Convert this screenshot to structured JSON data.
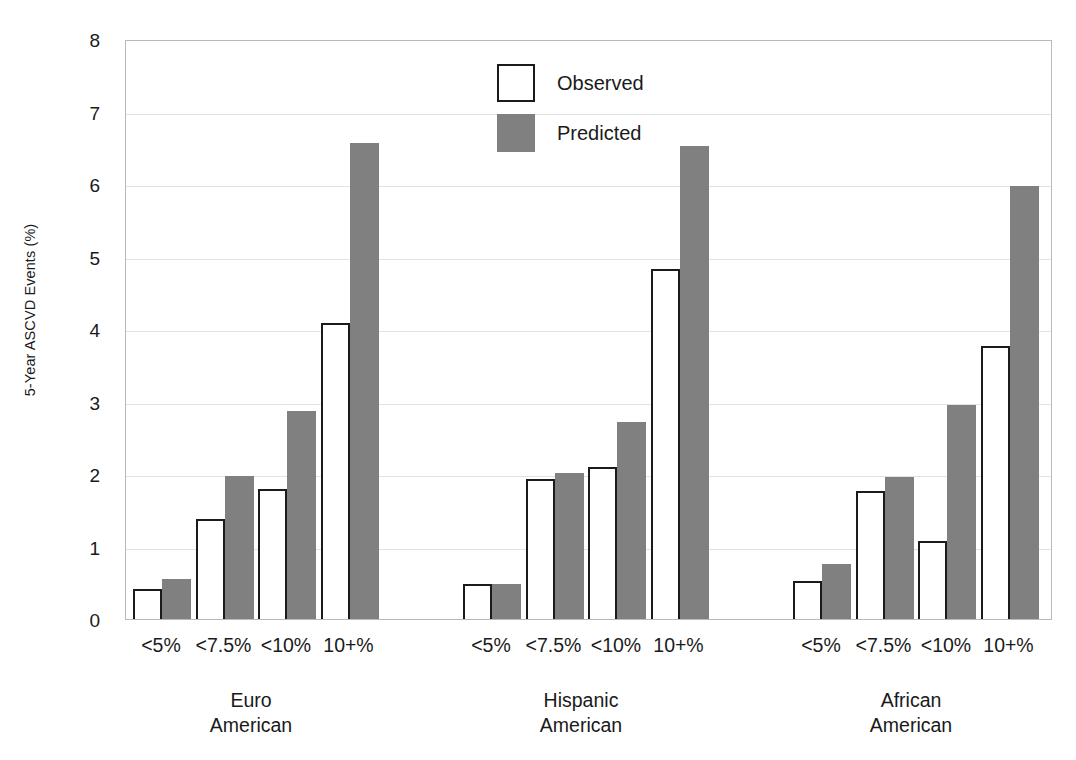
{
  "chart_data": {
    "type": "bar",
    "title": "",
    "subtitle": "",
    "xlabel": "",
    "ylabel": "5-Year ASCVD Events (%)",
    "ylim": [
      0,
      8
    ],
    "yticks": [
      0,
      1,
      2,
      3,
      4,
      5,
      6,
      7,
      8
    ],
    "ytick_labels": [
      "0",
      "1",
      "2",
      "3",
      "4",
      "5",
      "6",
      "7",
      "8"
    ],
    "grid": true,
    "legend_position": "top-center",
    "categories": [
      "<5%",
      "<7.5%",
      "<10%",
      "10+%"
    ],
    "groups": [
      "Euro American",
      "Hispanic American",
      "African American"
    ],
    "group_labels": [
      {
        "line1": "Euro",
        "line2": "American"
      },
      {
        "line1": "Hispanic",
        "line2": "American"
      },
      {
        "line1": "African",
        "line2": "American"
      }
    ],
    "series": [
      {
        "name": "Observed",
        "color": "#ffffff",
        "edge_color": "#1b1b1b",
        "values_by_group": {
          "Euro American": [
            0.42,
            1.38,
            1.79,
            4.08
          ],
          "Hispanic American": [
            0.48,
            1.93,
            2.09,
            4.83
          ],
          "African American": [
            0.52,
            1.77,
            1.08,
            3.77
          ]
        }
      },
      {
        "name": "Predicted",
        "color": "#808080",
        "edge_color": "#808080",
        "values_by_group": {
          "Euro American": [
            0.55,
            1.97,
            2.87,
            6.57
          ],
          "Hispanic American": [
            0.48,
            2.02,
            2.72,
            6.52
          ],
          "African American": [
            0.76,
            1.96,
            2.95,
            5.97
          ]
        }
      }
    ]
  },
  "legend": {
    "items": [
      {
        "label": "Observed",
        "swatch": "observed"
      },
      {
        "label": "Predicted",
        "swatch": "predicted"
      }
    ]
  },
  "colors": {
    "predicted_fill": "#808080",
    "observed_fill": "#ffffff",
    "bar_edge": "#1b1b1b",
    "gridline": "#e2e2e2",
    "plot_border": "#b9b9b9",
    "text": "#1a1a1a",
    "background": "#ffffff"
  }
}
